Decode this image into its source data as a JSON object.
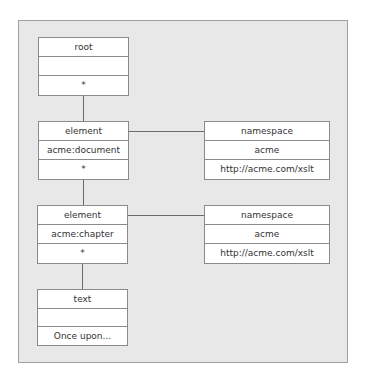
{
  "diagram": {
    "nodes": [
      {
        "id": "root",
        "type": "root",
        "name": "",
        "value": "*"
      },
      {
        "id": "element-document",
        "type": "element",
        "name": "acme:document",
        "value": "*"
      },
      {
        "id": "element-chapter",
        "type": "element",
        "name": "acme:chapter",
        "value": "*"
      },
      {
        "id": "text",
        "type": "text",
        "name": "",
        "value": "Once upon..."
      },
      {
        "id": "namespace-1",
        "type": "namespace",
        "name": "acme",
        "value": "http://acme.com/xslt"
      },
      {
        "id": "namespace-2",
        "type": "namespace",
        "name": "acme",
        "value": "http://acme.com/xslt"
      }
    ],
    "edges": [
      {
        "from": "root",
        "to": "element-document"
      },
      {
        "from": "element-document",
        "to": "element-chapter"
      },
      {
        "from": "element-chapter",
        "to": "text"
      },
      {
        "from": "element-document",
        "to": "namespace-1"
      },
      {
        "from": "element-chapter",
        "to": "namespace-2"
      }
    ]
  }
}
